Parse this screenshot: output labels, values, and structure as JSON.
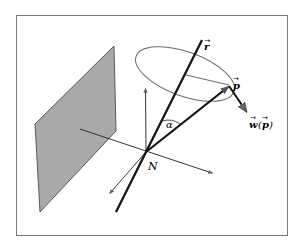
{
  "figure": {
    "labels": {
      "r": "r",
      "p": "p",
      "w": "w",
      "w_arg_open": "(",
      "w_arg": "p",
      "w_arg_close": ")",
      "alpha": "α",
      "N": "N"
    },
    "colors": {
      "frame": "#7a7a7a",
      "plane_fill": "#a9a9a9",
      "plane_edge": "#3a3a3a",
      "thick_line": "#111111",
      "thin_line": "#222222",
      "ellipse": "#6a6a6a",
      "arrow_head": "#666666"
    }
  }
}
